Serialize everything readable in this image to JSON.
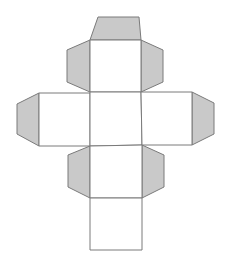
{
  "diagram": {
    "type": "polyhedron-net",
    "colors": {
      "face_fill": "#ffffff",
      "flap_fill": "#c9c9c9",
      "stroke": "#7a7a7a",
      "background": "#ffffff"
    },
    "faces": [
      {
        "id": "top",
        "points": "90,40 141,40 141,92 90,92"
      },
      {
        "id": "left",
        "points": "39,93 90,93 90,146 39,146"
      },
      {
        "id": "center",
        "points": "90,92 141,92 142,145 90,146"
      },
      {
        "id": "right",
        "points": "141,92 192,92 192,145 142,145"
      },
      {
        "id": "lower",
        "points": "90,146 142,145 142,198 90,198"
      },
      {
        "id": "bottom",
        "points": "90,198 142,198 142,250 90,250"
      }
    ],
    "flaps": [
      {
        "id": "top-cap",
        "points": "90,40 98,17 139,17 141,40"
      },
      {
        "id": "upper-left",
        "points": "90,40 67,50 67,82 90,92"
      },
      {
        "id": "upper-right",
        "points": "141,40 163,50 163,82 141,92"
      },
      {
        "id": "left-side",
        "points": "39,93 17,104 17,134 39,146"
      },
      {
        "id": "right-side",
        "points": "192,92 214,103 214,134 192,145"
      },
      {
        "id": "lower-left",
        "points": "90,146 68,155 68,187 90,198"
      },
      {
        "id": "lower-right",
        "points": "142,145 164,155 164,187 142,198"
      }
    ]
  }
}
